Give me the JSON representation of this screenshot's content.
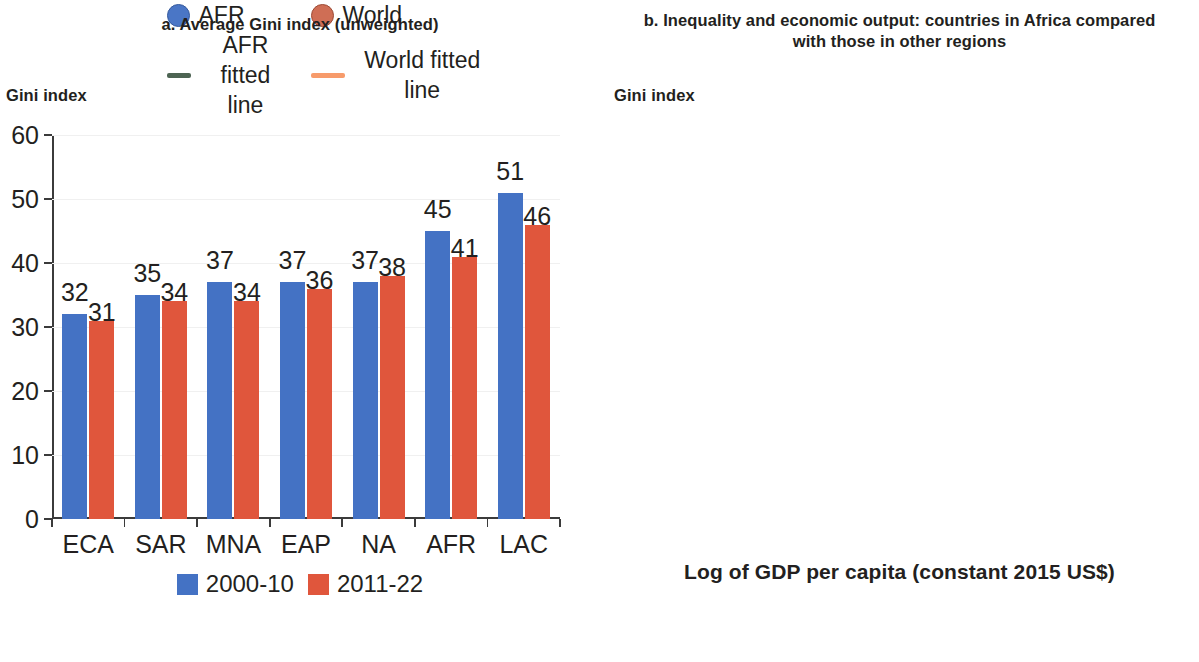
{
  "panel_a": {
    "title": "a. Average Gini index (unweighted)",
    "ylabel": "Gini index"
  },
  "panel_b": {
    "title": "b. Inequality and economic output: countries in Africa compared with those in other regions",
    "ylabel": "Gini index",
    "xlabel": "Log of GDP per capita (constant 2015 US$)"
  },
  "colors": {
    "series_2000_10": "#4472c4",
    "series_2011_22": "#e0563c",
    "afr_point": "#4a76c6",
    "world_point": "#cf6e55",
    "afr_line": "#4d6453",
    "world_line": "#f79b6b",
    "axis": "#3b3b3b",
    "text": "#231f20"
  },
  "chart_data": [
    {
      "type": "bar",
      "title": "a. Average Gini index (unweighted)",
      "xlabel": "",
      "ylabel": "Gini index",
      "ylim": [
        0,
        60
      ],
      "yticks": [
        0,
        10,
        20,
        30,
        40,
        50,
        60
      ],
      "grid": false,
      "legend_position": "bottom",
      "categories": [
        "ECA",
        "SAR",
        "MNA",
        "EAP",
        "NA",
        "AFR",
        "LAC"
      ],
      "series": [
        {
          "name": "2000-10",
          "color": "#4472c4",
          "values": [
            32,
            35,
            37,
            37,
            37,
            45,
            51
          ]
        },
        {
          "name": "2011-22",
          "color": "#e0563c",
          "values": [
            31,
            34,
            34,
            36,
            38,
            41,
            46
          ]
        }
      ]
    },
    {
      "type": "scatter",
      "title": "b. Inequality and economic output: countries in Africa compared with those in other regions",
      "xlabel": "Log of GDP per capita (constant 2015 US$)",
      "ylabel": "Gini index",
      "xlim": [
        5,
        10
      ],
      "ylim": [
        20,
        70
      ],
      "xticks": [
        5,
        6,
        7,
        8,
        9,
        10
      ],
      "yticks": [
        20,
        25,
        30,
        35,
        40,
        45,
        50,
        55,
        60,
        65,
        70
      ],
      "grid": false,
      "legend_position": "bottom",
      "series": [
        {
          "name": "AFR",
          "color": "#4a76c6",
          "marker": "circle",
          "n_points": 300,
          "x_range": [
            5.4,
            9.0
          ],
          "y_range": [
            29,
            65
          ]
        },
        {
          "name": "World",
          "color": "#cf6e55",
          "marker": "circle",
          "n_points": 1250,
          "x_range": [
            5.85,
            10.0
          ],
          "y_range": [
            20,
            63
          ]
        }
      ],
      "fits": [
        {
          "name": "AFR fitted line",
          "color": "#4d6453",
          "shape": "linear",
          "points": [
            [
              5.45,
              39.6
            ],
            [
              6.5,
              42.0
            ],
            [
              7.5,
              44.5
            ],
            [
              8.5,
              47.4
            ],
            [
              9.95,
              51.1
            ]
          ]
        },
        {
          "name": "World fitted line",
          "color": "#f79b6b",
          "shape": "quadratic",
          "points": [
            [
              5.9,
              30.8
            ],
            [
              6.5,
              34.2
            ],
            [
              7.0,
              36.1
            ],
            [
              7.5,
              37.7
            ],
            [
              8.0,
              39.0
            ],
            [
              8.5,
              39.8
            ],
            [
              9.0,
              39.9
            ],
            [
              9.5,
              39.0
            ],
            [
              9.95,
              37.3
            ]
          ]
        }
      ]
    }
  ],
  "legend_a": [
    {
      "label": "2000-10",
      "color": "#4472c4"
    },
    {
      "label": "2011-22",
      "color": "#e0563c"
    }
  ],
  "legend_b": [
    {
      "label": "AFR",
      "type": "dot",
      "color": "#4a76c6"
    },
    {
      "label": "World",
      "type": "dot",
      "color": "#cf6e55"
    },
    {
      "label": "AFR fitted line",
      "type": "line",
      "color": "#4d6453"
    },
    {
      "label": "World fitted line",
      "type": "line",
      "color": "#f79b6b"
    }
  ]
}
